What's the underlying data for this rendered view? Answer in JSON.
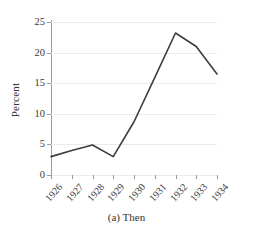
{
  "chart_data": {
    "type": "line",
    "title": "",
    "caption": "(a) Then",
    "xlabel": "",
    "ylabel": "Percent",
    "categories": [
      "1926",
      "1927",
      "1928",
      "1929",
      "1930",
      "1931",
      "1932",
      "1933",
      "1934"
    ],
    "values": [
      3.0,
      4.0,
      4.9,
      3.0,
      8.7,
      15.9,
      23.2,
      21.0,
      16.5
    ],
    "series": [
      {
        "name": "Percent",
        "values": [
          3.0,
          4.0,
          4.9,
          3.0,
          8.7,
          15.9,
          23.2,
          21.0,
          16.5
        ]
      }
    ],
    "ylim": [
      0,
      25
    ],
    "yticks": [
      0,
      5,
      10,
      15,
      20,
      25
    ],
    "ytick_labels": [
      "0",
      "5",
      "10",
      "15",
      "20",
      "25"
    ],
    "grid": "horizontal",
    "legend": "none",
    "line_color": "#3d3d3d",
    "grid_color": "#ebebeb",
    "axis_color": "#9a9a9a"
  }
}
